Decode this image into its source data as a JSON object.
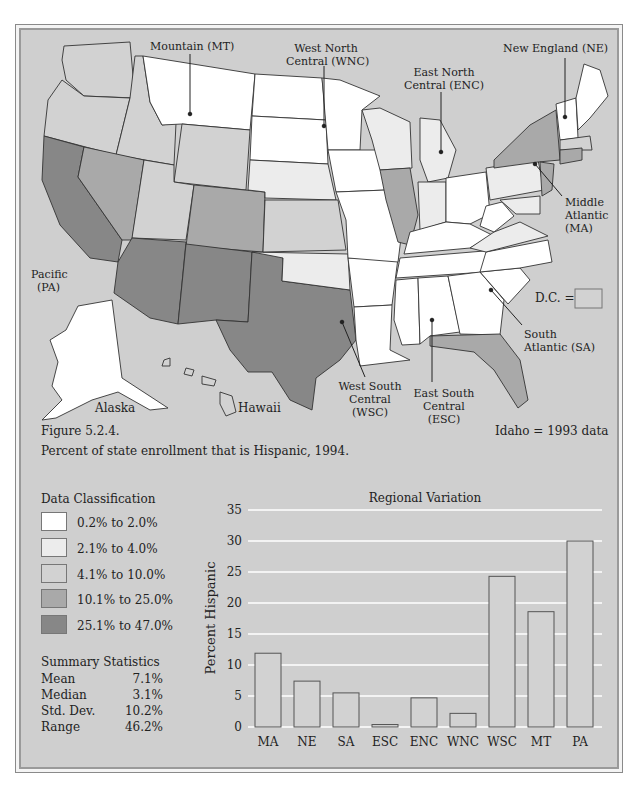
{
  "map": {
    "region_labels": {
      "mountain": "Mountain (MT)",
      "wnc_line1": "West North",
      "wnc_line2": "Central (WNC)",
      "enc_line1": "East North",
      "enc_line2": "Central (ENC)",
      "ne": "New England (NE)",
      "ma_line1": "Middle",
      "ma_line2": "Atlantic",
      "ma_line3": "(MA)",
      "pa_line1": "Pacific",
      "pa_line2": "(PA)",
      "sa_line1": "South",
      "sa_line2": "Atlantic (SA)",
      "wsc_line1": "West South",
      "wsc_line2": "Central",
      "wsc_line3": "(WSC)",
      "esc_line1": "East South",
      "esc_line2": "Central",
      "esc_line3": "(ESC)",
      "alaska": "Alaska",
      "hawaii": "Hawaii"
    },
    "dc_label": "D.C. =",
    "idaho_note": "Idaho = 1993 data",
    "colors": {
      "class1": "#ffffff",
      "class2": "#ececec",
      "class3": "#d2d2d2",
      "class4": "#a9a9a9",
      "class5": "#878787",
      "water": "#cfcfcf"
    }
  },
  "caption": {
    "figure": "Figure 5.2.4.",
    "text": "Percent of state enrollment that is Hispanic, 1994."
  },
  "legend": {
    "title": "Data Classification",
    "items": [
      {
        "label": "0.2% to 2.0%",
        "color": "#ffffff"
      },
      {
        "label": "2.1% to 4.0%",
        "color": "#ececec"
      },
      {
        "label": "4.1% to 10.0%",
        "color": "#d2d2d2"
      },
      {
        "label": "10.1% to 25.0%",
        "color": "#a9a9a9"
      },
      {
        "label": "25.1% to 47.0%",
        "color": "#878787"
      }
    ]
  },
  "stats": {
    "title": "Summary Statistics",
    "rows": [
      {
        "k": "Mean",
        "v": "7.1%"
      },
      {
        "k": "Median",
        "v": "3.1%"
      },
      {
        "k": "Std. Dev.",
        "v": "10.2%"
      },
      {
        "k": "Range",
        "v": "46.2%"
      }
    ]
  },
  "chart_data": {
    "type": "bar",
    "title": "Regional Variation",
    "xlabel": "",
    "ylabel": "Percent Hispanic",
    "categories": [
      "MA",
      "NE",
      "SA",
      "ESC",
      "ENC",
      "WNC",
      "WSC",
      "MT",
      "PA"
    ],
    "values": [
      11.9,
      7.4,
      5.5,
      0.4,
      4.7,
      2.2,
      24.3,
      18.6,
      30.0
    ],
    "ylim": [
      0,
      35
    ],
    "yticks": [
      0,
      5,
      10,
      15,
      20,
      25,
      30,
      35
    ],
    "grid": true,
    "legend": "none",
    "bar_color": "#d2d2d2"
  }
}
